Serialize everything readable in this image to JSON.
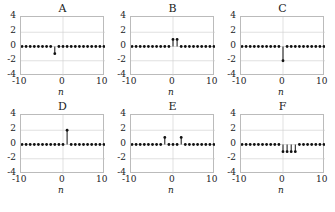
{
  "chart_data": [
    {
      "type": "stem",
      "title": "A",
      "xlabel": "n",
      "ylabel": "",
      "xlim": [
        -10,
        10
      ],
      "ylim": [
        -4,
        4
      ],
      "xticks": [
        "-10",
        "0",
        "10"
      ],
      "yticks": [
        "4",
        "2",
        "0",
        "-2",
        "-4"
      ],
      "grid": true,
      "nonzero": [
        {
          "n": -2,
          "value": -1
        }
      ]
    },
    {
      "type": "stem",
      "title": "B",
      "xlabel": "n",
      "ylabel": "",
      "xlim": [
        -10,
        10
      ],
      "ylim": [
        -4,
        4
      ],
      "xticks": [
        "-10",
        "0",
        "10"
      ],
      "yticks": [
        "4",
        "2",
        "0",
        "-2",
        "-4"
      ],
      "grid": true,
      "nonzero": [
        {
          "n": 0,
          "value": 1
        },
        {
          "n": 1,
          "value": 1
        }
      ]
    },
    {
      "type": "stem",
      "title": "C",
      "xlabel": "n",
      "ylabel": "",
      "xlim": [
        -10,
        10
      ],
      "ylim": [
        -4,
        4
      ],
      "xticks": [
        "-10",
        "0",
        "10"
      ],
      "yticks": [
        "4",
        "2",
        "0",
        "-2",
        "-4"
      ],
      "grid": true,
      "nonzero": [
        {
          "n": 0,
          "value": -2
        }
      ]
    },
    {
      "type": "stem",
      "title": "D",
      "xlabel": "n",
      "ylabel": "",
      "xlim": [
        -10,
        10
      ],
      "ylim": [
        -4,
        4
      ],
      "xticks": [
        "-10",
        "0",
        "10"
      ],
      "yticks": [
        "4",
        "2",
        "0",
        "-2",
        "-4"
      ],
      "grid": true,
      "nonzero": [
        {
          "n": 1,
          "value": 2
        }
      ]
    },
    {
      "type": "stem",
      "title": "E",
      "xlabel": "n",
      "ylabel": "",
      "xlim": [
        -10,
        10
      ],
      "ylim": [
        -4,
        4
      ],
      "xticks": [
        "-10",
        "0",
        "10"
      ],
      "yticks": [
        "4",
        "2",
        "0",
        "-2",
        "-4"
      ],
      "grid": true,
      "nonzero": [
        {
          "n": -2,
          "value": 1
        },
        {
          "n": 2,
          "value": 1
        }
      ]
    },
    {
      "type": "stem",
      "title": "F",
      "xlabel": "n",
      "ylabel": "",
      "xlim": [
        -10,
        10
      ],
      "ylim": [
        -4,
        4
      ],
      "xticks": [
        "-10",
        "0",
        "10"
      ],
      "yticks": [
        "4",
        "2",
        "0",
        "-2",
        "-4"
      ],
      "grid": true,
      "nonzero": [
        {
          "n": 0,
          "value": -1
        },
        {
          "n": 1,
          "value": -1
        },
        {
          "n": 2,
          "value": -1
        },
        {
          "n": 3,
          "value": -1
        }
      ]
    }
  ],
  "layout": {
    "positions": [
      [
        0,
        2
      ],
      [
        110,
        2
      ],
      [
        220,
        2
      ],
      [
        0,
        100
      ],
      [
        110,
        100
      ],
      [
        220,
        100
      ]
    ],
    "line_color": "#111111",
    "grid_color": "#cccccc"
  }
}
